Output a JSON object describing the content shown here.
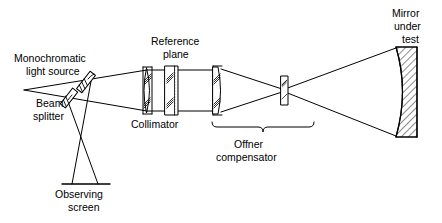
{
  "figure": {
    "type": "optical-schematic",
    "background_color": "#ffffff",
    "stroke_color": "#000000"
  },
  "labels": {
    "light_source_l1": "Monochromatic",
    "light_source_l2": "light source",
    "beam_splitter_l1": "Beam",
    "beam_splitter_l2": "splitter",
    "observing_screen_l1": "Observing",
    "observing_screen_l2": "screen",
    "reference_plane_l1": "Reference",
    "reference_plane_l2": "plane",
    "collimator": "Collimator",
    "offner_l1": "Offner",
    "offner_l2": "compensator",
    "mirror_l1": "Mirror",
    "mirror_l2": "under",
    "mirror_l3": "test"
  },
  "components": [
    {
      "name": "monochromatic-light-source",
      "kind": "tilted-hatched-element"
    },
    {
      "name": "beam-splitter",
      "kind": "tilted-plate"
    },
    {
      "name": "observing-screen",
      "kind": "flat-screen"
    },
    {
      "name": "collimator",
      "kind": "biconvex-lens"
    },
    {
      "name": "reference-plane",
      "kind": "flat-plate-stippled"
    },
    {
      "name": "offner-compensator-lens",
      "kind": "plano-convex-lens"
    },
    {
      "name": "offner-field-lens",
      "kind": "small-lens"
    },
    {
      "name": "mirror-under-test",
      "kind": "concave-hatched-mirror"
    }
  ]
}
